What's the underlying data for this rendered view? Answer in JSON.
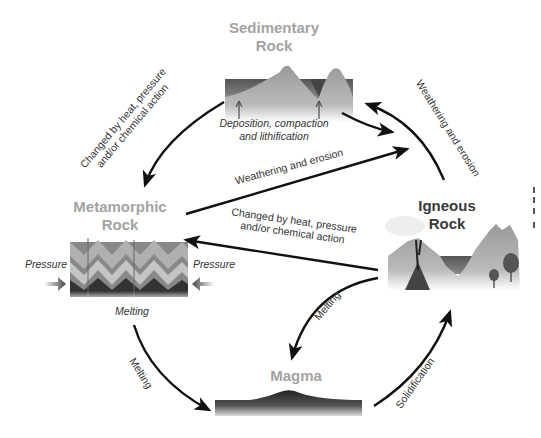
{
  "diagram": {
    "type": "rock-cycle",
    "nodes": {
      "sedimentary": {
        "title_line1": "Sedimentary",
        "title_line2": "Rock",
        "caption_line1": "Deposition, compaction",
        "caption_line2": "and lithification"
      },
      "metamorphic": {
        "title_line1": "Metamorphic",
        "title_line2": "Rock",
        "pressure_left": "Pressure",
        "pressure_right": "Pressure",
        "caption": "Melting"
      },
      "igneous": {
        "title_line1": "Igneous",
        "title_line2": "Rock"
      },
      "magma": {
        "title": "Magma"
      }
    },
    "edges": {
      "sed_to_meta": {
        "line1": "Changed by heat, pressure",
        "line2": "and/or chemical action"
      },
      "ign_to_sed": {
        "label": "Weathering and erosion"
      },
      "meta_to_sed": {
        "label": "Weathering and erosion"
      },
      "ign_to_meta": {
        "line1": "Changed by heat, pressure",
        "line2": "and/or chemical action"
      },
      "meta_to_magma": {
        "label": "Melting"
      },
      "ign_to_magma": {
        "label": "Melting"
      },
      "magma_to_ign": {
        "label": "Solidification"
      }
    },
    "colors": {
      "title_gray": "#a3a3a3",
      "title_dark": "#3a3a3a",
      "arrow": "#111111"
    }
  }
}
